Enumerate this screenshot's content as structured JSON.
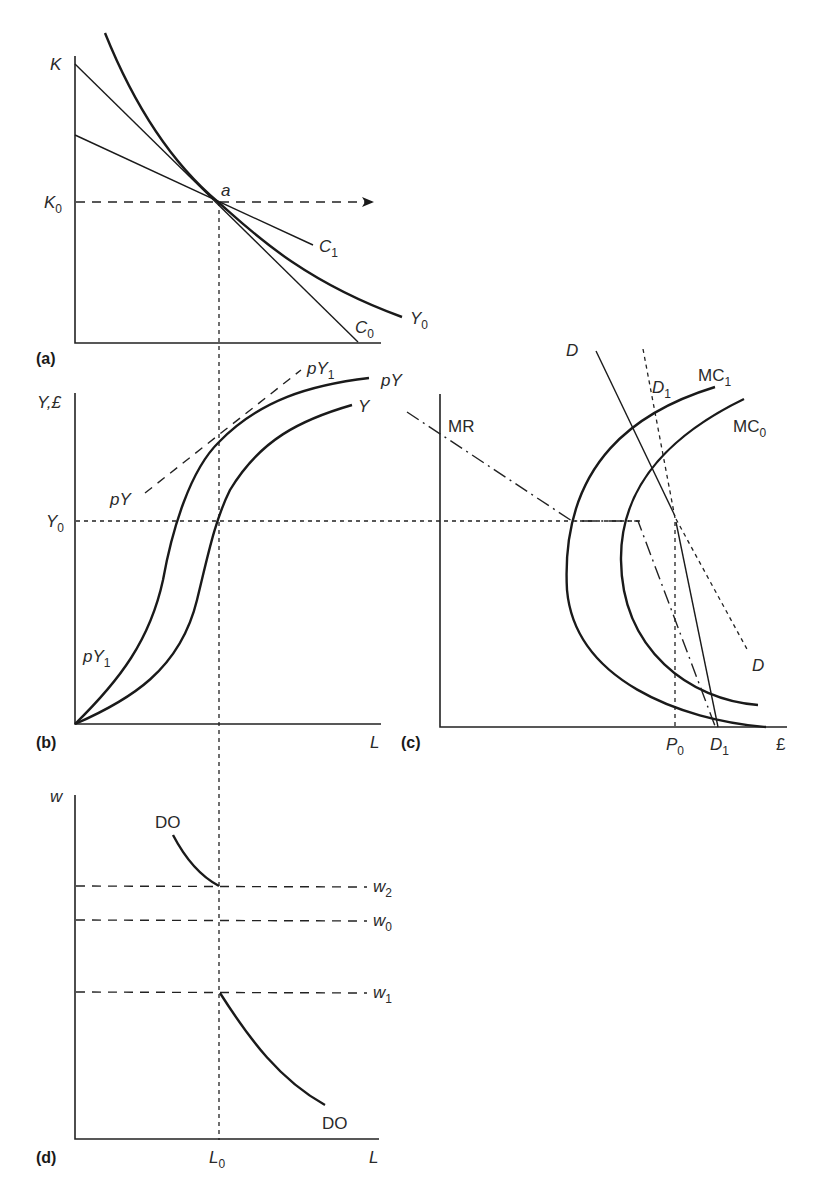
{
  "panels": {
    "a": {
      "tag": "(a)",
      "y_axis_label": "K",
      "k0_label": "K",
      "k0_sub": "0",
      "point_label": "a",
      "c1_label": "C",
      "c1_sub": "1",
      "c0_label": "C",
      "c0_sub": "0",
      "isoquant_label": "Y",
      "isoquant_sub": "0"
    },
    "b": {
      "tag": "(b)",
      "y_axis_label": "Y,£",
      "y0_label": "Y",
      "y0_sub": "0",
      "x_axis_label": "L",
      "py1_top_label": "pY",
      "py1_top_sub": "1",
      "py_curve_label": "pY",
      "y_curve_label": "Y",
      "py_dashed_label": "pY",
      "py1_bottom_label": "pY",
      "py1_bottom_sub": "1"
    },
    "c": {
      "tag": "(c)",
      "mr_label": "MR",
      "d_top_label": "D",
      "d1_top_label": "D",
      "d1_top_sub": "1",
      "mc1_label": "MC",
      "mc1_sub": "1",
      "mc0_label": "MC",
      "mc0_sub": "0",
      "d_bottom_label": "D",
      "p0_label": "P",
      "p0_sub": "0",
      "d1_bottom_label": "D",
      "d1_bottom_sub": "1",
      "x_axis_label": "£"
    },
    "d": {
      "tag": "(d)",
      "y_axis_label": "w",
      "do_top_label": "DO",
      "do_bottom_label": "DO",
      "w2_label": "w",
      "w2_sub": "2",
      "w0_label": "w",
      "w0_sub": "0",
      "w1_label": "w",
      "w1_sub": "1",
      "l0_label": "L",
      "l0_sub": "0",
      "x_axis_label": "L"
    }
  }
}
